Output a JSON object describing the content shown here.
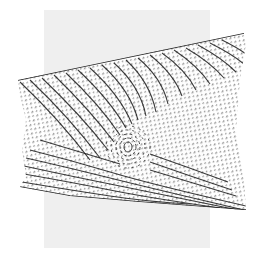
{
  "image": {
    "subject": "fingerprint-impression",
    "description": "Skewed fingerprint ridge pattern over a light gray rectangle",
    "colors": {
      "background": "#ffffff",
      "card": "#efefef",
      "ridge": "#1a1a1a"
    },
    "regions": {
      "card": {
        "x": 44,
        "y": 10,
        "w": 166,
        "h": 238
      },
      "print_top_edge": [
        [
          18,
          80
        ],
        [
          244,
          33
        ]
      ],
      "print_bottom_edge": [
        [
          20,
          187
        ],
        [
          246,
          210
        ]
      ],
      "core": {
        "x": 128,
        "y": 147
      }
    }
  }
}
